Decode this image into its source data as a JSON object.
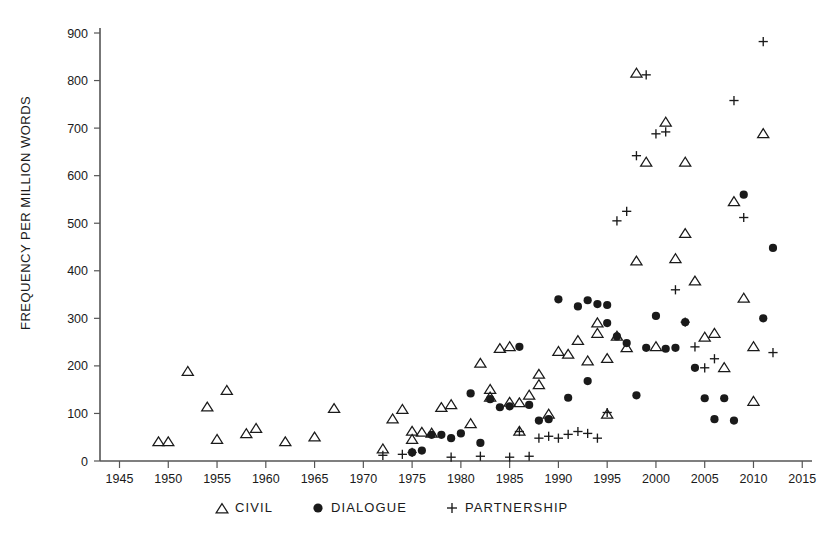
{
  "chart_data": {
    "type": "scatter",
    "title": "",
    "subtitle": "",
    "xlabel": "",
    "ylabel": "FREQUENCY PER MILLION WORDS",
    "xlim": [
      1943,
      2016
    ],
    "ylim": [
      0,
      920
    ],
    "grid": false,
    "legend_position": "bottom",
    "xticks": [
      1945,
      1950,
      1955,
      1960,
      1965,
      1970,
      1975,
      1980,
      1985,
      1990,
      1995,
      2000,
      2005,
      2010,
      2015
    ],
    "yticks": [
      0,
      100,
      200,
      300,
      400,
      500,
      600,
      700,
      800,
      900
    ],
    "series": [
      {
        "name": "CIVIL",
        "marker": "triangle-open",
        "color": "#1a1a1a",
        "points": [
          [
            1949,
            40
          ],
          [
            1950,
            40
          ],
          [
            1952,
            188
          ],
          [
            1954,
            113
          ],
          [
            1955,
            45
          ],
          [
            1956,
            148
          ],
          [
            1958,
            57
          ],
          [
            1959,
            68
          ],
          [
            1962,
            40
          ],
          [
            1965,
            50
          ],
          [
            1967,
            110
          ],
          [
            1972,
            25
          ],
          [
            1973,
            88
          ],
          [
            1974,
            108
          ],
          [
            1975,
            62
          ],
          [
            1975,
            45
          ],
          [
            1976,
            60
          ],
          [
            1977,
            58
          ],
          [
            1978,
            112
          ],
          [
            1979,
            118
          ],
          [
            1981,
            78
          ],
          [
            1982,
            205
          ],
          [
            1983,
            150
          ],
          [
            1983,
            134
          ],
          [
            1984,
            236
          ],
          [
            1985,
            240
          ],
          [
            1985,
            123
          ],
          [
            1986,
            122
          ],
          [
            1986,
            62
          ],
          [
            1987,
            138
          ],
          [
            1988,
            182
          ],
          [
            1988,
            160
          ],
          [
            1989,
            98
          ],
          [
            1990,
            230
          ],
          [
            1991,
            224
          ],
          [
            1992,
            253
          ],
          [
            1993,
            210
          ],
          [
            1994,
            268
          ],
          [
            1994,
            290
          ],
          [
            1995,
            215
          ],
          [
            1995,
            98
          ],
          [
            1996,
            262
          ],
          [
            1997,
            238
          ],
          [
            1998,
            420
          ],
          [
            1998,
            815
          ],
          [
            1999,
            628
          ],
          [
            2000,
            240
          ],
          [
            2001,
            712
          ],
          [
            2002,
            425
          ],
          [
            2003,
            478
          ],
          [
            2003,
            628
          ],
          [
            2004,
            378
          ],
          [
            2005,
            260
          ],
          [
            2006,
            268
          ],
          [
            2007,
            196
          ],
          [
            2008,
            545
          ],
          [
            2009,
            342
          ],
          [
            2010,
            125
          ],
          [
            2010,
            240
          ],
          [
            2011,
            688
          ]
        ]
      },
      {
        "name": "DIALOGUE",
        "marker": "circle-filled",
        "color": "#1a1a1a",
        "points": [
          [
            1975,
            18
          ],
          [
            1976,
            22
          ],
          [
            1977,
            55
          ],
          [
            1978,
            55
          ],
          [
            1979,
            48
          ],
          [
            1980,
            58
          ],
          [
            1981,
            142
          ],
          [
            1982,
            38
          ],
          [
            1983,
            130
          ],
          [
            1984,
            113
          ],
          [
            1985,
            115
          ],
          [
            1986,
            240
          ],
          [
            1987,
            118
          ],
          [
            1988,
            85
          ],
          [
            1989,
            88
          ],
          [
            1990,
            340
          ],
          [
            1991,
            133
          ],
          [
            1992,
            325
          ],
          [
            1993,
            338
          ],
          [
            1993,
            168
          ],
          [
            1994,
            330
          ],
          [
            1995,
            328
          ],
          [
            1995,
            290
          ],
          [
            1996,
            262
          ],
          [
            1997,
            248
          ],
          [
            1998,
            138
          ],
          [
            1999,
            238
          ],
          [
            2000,
            305
          ],
          [
            2001,
            236
          ],
          [
            2002,
            238
          ],
          [
            2003,
            292
          ],
          [
            2004,
            196
          ],
          [
            2005,
            132
          ],
          [
            2006,
            88
          ],
          [
            2007,
            132
          ],
          [
            2008,
            85
          ],
          [
            2009,
            560
          ],
          [
            2011,
            300
          ],
          [
            2012,
            448
          ]
        ]
      },
      {
        "name": "PARTNERSHIP",
        "marker": "plus",
        "color": "#1a1a1a",
        "points": [
          [
            1972,
            12
          ],
          [
            1974,
            14
          ],
          [
            1975,
            18
          ],
          [
            1979,
            8
          ],
          [
            1982,
            10
          ],
          [
            1985,
            8
          ],
          [
            1986,
            62
          ],
          [
            1987,
            10
          ],
          [
            1988,
            48
          ],
          [
            1989,
            52
          ],
          [
            1990,
            48
          ],
          [
            1991,
            56
          ],
          [
            1992,
            62
          ],
          [
            1993,
            58
          ],
          [
            1994,
            48
          ],
          [
            1995,
            102
          ],
          [
            1996,
            505
          ],
          [
            1997,
            525
          ],
          [
            1998,
            642
          ],
          [
            1999,
            812
          ],
          [
            2000,
            688
          ],
          [
            2001,
            692
          ],
          [
            2002,
            360
          ],
          [
            2003,
            292
          ],
          [
            2004,
            240
          ],
          [
            2005,
            196
          ],
          [
            2006,
            215
          ],
          [
            2008,
            758
          ],
          [
            2009,
            512
          ],
          [
            2011,
            882
          ],
          [
            2012,
            228
          ]
        ]
      }
    ],
    "legend": [
      {
        "label": "CIVIL",
        "marker": "triangle-open"
      },
      {
        "label": "DIALOGUE",
        "marker": "circle-filled"
      },
      {
        "label": "PARTNERSHIP",
        "marker": "plus"
      }
    ]
  }
}
